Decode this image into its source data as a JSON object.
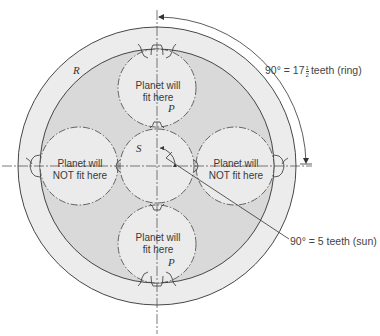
{
  "diagram": {
    "colors": {
      "ring_band": "#ececec",
      "inner_area": "#d9d9d9",
      "planet_fill": "#ebebeb",
      "line": "#333333"
    },
    "labels": {
      "ring": "R",
      "sun": "S",
      "planet_top": "P",
      "planet_bottom": "P",
      "planet_top_text_1": "Planet will",
      "planet_top_text_2": "fit here",
      "planet_bottom_text_1": "Planet will",
      "planet_bottom_text_2": "fit here",
      "planet_left_text_1": "Planet will",
      "planet_left_text_2": "NOT fit here",
      "planet_right_text_1": "Planet will",
      "planet_right_text_2": "NOT fit here"
    },
    "annotations": {
      "ring_angle_prefix": "90° = 17",
      "ring_frac_num": "1",
      "ring_frac_den": "2",
      "ring_angle_suffix": "teeth (ring)",
      "sun_angle": "90° = 5 teeth (sun)"
    }
  }
}
